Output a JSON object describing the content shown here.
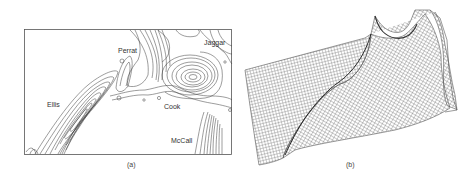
{
  "figure": {
    "panels": [
      {
        "id": "a",
        "type": "contour-map",
        "caption": "(a)",
        "place_labels": [
          {
            "text": "Perrat",
            "x": 118,
            "y": 47
          },
          {
            "text": "Jaggar",
            "x": 204,
            "y": 39
          },
          {
            "text": "Ellis",
            "x": 47,
            "y": 101
          },
          {
            "text": "Cook",
            "x": 164,
            "y": 103
          },
          {
            "text": "McCall",
            "x": 171,
            "y": 137
          }
        ]
      },
      {
        "id": "b",
        "type": "3d-wireframe-surface",
        "caption": "(b)"
      }
    ]
  },
  "colors": {
    "line": "#3a3a3a",
    "mesh": "#555555",
    "background": "#ffffff"
  }
}
